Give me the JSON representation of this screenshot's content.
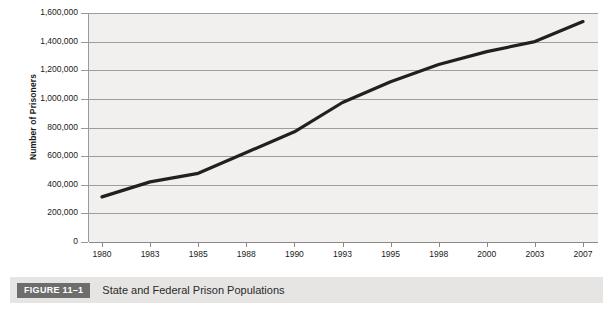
{
  "figure": {
    "badge_label": "FIGURE 11–1",
    "caption": "State and Federal Prison Populations",
    "badge_color": "#6d6d6d",
    "caption_bar_color": "#e6e5e3"
  },
  "chart_data": {
    "type": "line",
    "title": "State and Federal Prison Populations",
    "xlabel": "",
    "ylabel": "Number of Prisoners",
    "categories": [
      "1980",
      "1983",
      "1985",
      "1988",
      "1990",
      "1993",
      "1995",
      "1998",
      "2000",
      "2003",
      "2007"
    ],
    "values": [
      315000,
      420000,
      480000,
      625000,
      770000,
      975000,
      1120000,
      1240000,
      1330000,
      1400000,
      1540000
    ],
    "series": [
      {
        "name": "Number of Prisoners",
        "values": [
          315000,
          420000,
          480000,
          625000,
          770000,
          975000,
          1120000,
          1240000,
          1330000,
          1400000,
          1540000
        ]
      }
    ],
    "ylim": [
      0,
      1600000
    ],
    "ytick_values": [
      0,
      200000,
      400000,
      600000,
      800000,
      1000000,
      1200000,
      1400000,
      1600000
    ],
    "ytick_labels": [
      "0",
      "200,000",
      "400,000",
      "600,000",
      "800,000",
      "1,000,000",
      "1,200,000",
      "1,400,000",
      "1,600,000"
    ],
    "xtick_labels": [
      "1980",
      "1983",
      "1985",
      "1988",
      "1990",
      "1993",
      "1995",
      "1998",
      "2000",
      "2003",
      "2007"
    ],
    "grid": "horizontal",
    "legend": "none",
    "line_color": "#231f20",
    "plot_background": "#f1f0ee",
    "gridline_color": "#9d9d9d"
  }
}
